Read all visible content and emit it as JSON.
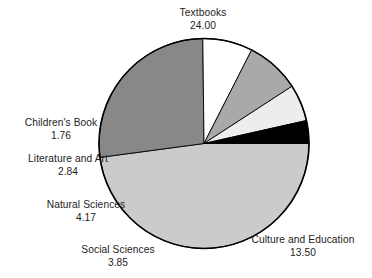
{
  "chart_data": {
    "type": "pie",
    "title": "",
    "categories": [
      "Textbooks",
      "Culture and Education",
      "Social Sciences",
      "Natural Sciences",
      "Literature and Art",
      "Children's Book"
    ],
    "values": [
      24.0,
      13.5,
      3.85,
      4.17,
      2.84,
      1.76
    ],
    "value_labels": [
      "24.00",
      "13.50",
      "3.85",
      "4.17",
      "2.84",
      "1.76"
    ],
    "total": 50.12,
    "legend": "none",
    "grid": false,
    "xlabel": "",
    "ylabel": "",
    "slice_colors": [
      "#cbcbcb",
      "#888888",
      "#ffffff",
      "#a9a9a9",
      "#ededed",
      "#000000"
    ],
    "outline_color": "#000000",
    "start_angle_deg": 0,
    "direction": "clockwise",
    "slices": [
      {
        "name": "Textbooks",
        "value": "24.00",
        "color": "#cbcbcb",
        "sweep_deg": 172.4
      },
      {
        "name": "Culture and Education",
        "value": "13.50",
        "color": "#888888",
        "sweep_deg": 96.97
      },
      {
        "name": "Social Sciences",
        "value": "3.85",
        "color": "#ffffff",
        "sweep_deg": 27.66
      },
      {
        "name": "Natural Sciences",
        "value": "4.17",
        "color": "#a9a9a9",
        "sweep_deg": 29.95
      },
      {
        "name": "Literature and Art",
        "value": "2.84",
        "color": "#ededed",
        "sweep_deg": 20.4
      },
      {
        "name": "Children's Book",
        "value": "1.76",
        "color": "#000000",
        "sweep_deg": 12.64
      }
    ]
  },
  "labels": {
    "textbooks": {
      "category": "Textbooks",
      "value": "24.00"
    },
    "culture": {
      "category": "Culture and Education",
      "value": "13.50"
    },
    "social": {
      "category": "Social Sciences",
      "value": "3.85"
    },
    "natural": {
      "category": "Natural Sciences",
      "value": "4.17"
    },
    "literature": {
      "category": "Literature and Art",
      "value": "2.84"
    },
    "children": {
      "category": "Children's Book",
      "value": "1.76"
    }
  }
}
